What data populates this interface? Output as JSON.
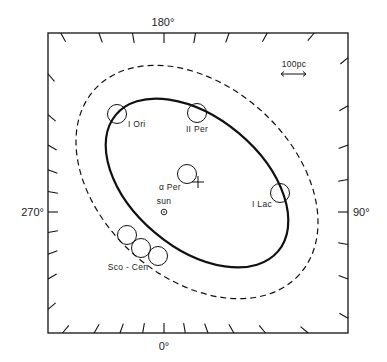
{
  "figure": {
    "type": "galactic-plane map (solar neighbourhood)",
    "axis_labels": {
      "top": "180°",
      "bottom": "0°",
      "left": "270°",
      "right": "90°"
    },
    "tick_interval_deg": 10,
    "scale_bar": {
      "label": "100pc",
      "length_pc": 100
    },
    "sun": {
      "label": "sun",
      "symbol": "⊙"
    },
    "associations": [
      {
        "id": "i-ori",
        "label": "I Ori"
      },
      {
        "id": "ii-per",
        "label": "II Per"
      },
      {
        "id": "alpha-per",
        "label": "α Per",
        "marker": "+"
      },
      {
        "id": "i-lac",
        "label": "I Lac"
      },
      {
        "id": "sco-cen",
        "label": "Sco - Cen",
        "count": 3
      }
    ],
    "curves": [
      {
        "id": "inner-ring",
        "style": "solid"
      },
      {
        "id": "outer-ring",
        "style": "dashed"
      }
    ],
    "colors": {
      "ink": "#111111",
      "background": "#ffffff"
    }
  }
}
